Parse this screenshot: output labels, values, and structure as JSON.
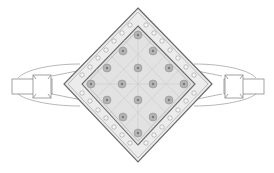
{
  "figure": {
    "colors": {
      "background": "#ffffff",
      "line": "#8a8a8a",
      "line_dark": "#6a6a6a",
      "fill_light": "#e6e6e6",
      "stone": "#9a9a9a"
    },
    "head": {
      "outer_diamond": {
        "top": [
          138,
          8
        ],
        "right": [
          212,
          84
        ],
        "bottom": [
          138,
          162
        ],
        "left": [
          64,
          84
        ]
      },
      "inner_diamond": {
        "top": [
          138,
          26
        ],
        "right": [
          195,
          84
        ],
        "bottom": [
          138,
          145
        ],
        "left": [
          82,
          84
        ]
      },
      "stone_grid": "4x4 rotated",
      "border_stones_per_side": 9
    },
    "band": {
      "left_shank": {
        "x": 12,
        "y": 78,
        "w": 40,
        "h": 16
      },
      "right_shank": {
        "x": 224,
        "y": 78,
        "w": 40,
        "h": 16
      }
    }
  }
}
